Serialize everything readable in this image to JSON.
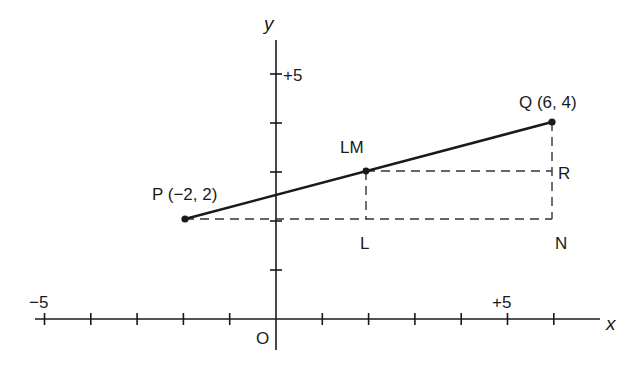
{
  "diagram": {
    "type": "coordinate-geometry",
    "axes": {
      "x_label": "x",
      "y_label": "y",
      "origin_label": "O",
      "x_tick_labels": [
        {
          "value": -5,
          "text": "−5"
        },
        {
          "value": 5,
          "text": "+5"
        }
      ],
      "y_tick_labels": [
        {
          "value": 5,
          "text": "+5"
        }
      ],
      "x_range": [
        -5.5,
        7
      ],
      "y_range": [
        -0.6,
        5.7
      ],
      "tick_step": 1
    },
    "points": [
      {
        "name": "P",
        "label": "P (−2, 2)",
        "x": -2,
        "y": 2
      },
      {
        "name": "LM",
        "label": "LM",
        "x": 2,
        "y": 3
      },
      {
        "name": "Q",
        "label": "Q (6, 4)",
        "x": 6,
        "y": 4
      }
    ],
    "aux_labels": [
      {
        "name": "L",
        "label": "L",
        "x": 2,
        "y": 2
      },
      {
        "name": "N",
        "label": "N",
        "x": 6,
        "y": 2
      },
      {
        "name": "R",
        "label": "R",
        "x": 6,
        "y": 3
      }
    ],
    "segments": [
      {
        "from": "P",
        "to": "Q",
        "style": "solid"
      },
      {
        "from": "P",
        "to": "N",
        "style": "dashed"
      },
      {
        "from": "LM",
        "to": "R",
        "style": "dashed"
      },
      {
        "from": "LM",
        "to": "L",
        "style": "dashed"
      },
      {
        "from": "Q",
        "to": "N",
        "style": "dashed"
      }
    ],
    "colors": {
      "ink": "#1a1a1a",
      "background": "#ffffff"
    }
  }
}
